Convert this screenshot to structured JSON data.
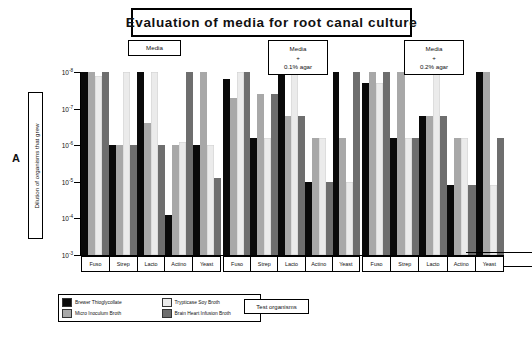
{
  "title": "Evaluation of media for root canal culture",
  "figure_letter": "A",
  "y_axis_title": "Dilution of organisms that grew",
  "x_axis_title": "Test organisms",
  "panels": [
    {
      "line1": "Media",
      "line2": "",
      "line3": ""
    },
    {
      "line1": "Media",
      "line2": "+",
      "line3": "0.1% agar"
    },
    {
      "line1": "Media",
      "line2": "+",
      "line3": "0.2% agar"
    }
  ],
  "legend": [
    {
      "label": "Brewer Thioglycollate",
      "color": "#0a0a0a"
    },
    {
      "label": "Trypticase Soy Broth",
      "color": "#ebebeb"
    },
    {
      "label": "Micro Inoculum Broth",
      "color": "#a8a8a8"
    },
    {
      "label": "Brain Heart Infusion Broth",
      "color": "#6e6e6e"
    }
  ],
  "chart_data": {
    "type": "bar",
    "title": "Evaluation of media for root canal culture",
    "xlabel": "Test organisms",
    "ylabel": "Dilution of organisms that grew",
    "y_tick_labels": [
      "10-8",
      "10-7",
      "10-6",
      "10-5",
      "10-4",
      "10-3"
    ],
    "y_exponents": [
      -8,
      -7,
      -6,
      -5,
      -4,
      -3
    ],
    "ylim": [
      -3,
      -8
    ],
    "grid": false,
    "legend_position": "bottom-left",
    "categories": [
      "Fuso",
      "Strep",
      "Lacto",
      "Actino",
      "Yeast"
    ],
    "panel_names": [
      "Media",
      "Media + 0.1% agar",
      "Media + 0.2% agar"
    ],
    "series": [
      {
        "name": "Brewer Thioglycollate",
        "color": "#0a0a0a"
      },
      {
        "name": "Micro Inoculum Broth",
        "color": "#a8a8a8"
      },
      {
        "name": "Trypticase Soy Broth",
        "color": "#ebebeb"
      },
      {
        "name": "Brain Heart Infusion Broth",
        "color": "#6e6e6e"
      }
    ],
    "panels": [
      {
        "name": "Media",
        "values": {
          "Brewer Thioglycollate": [
            -8.0,
            -6.0,
            -8.0,
            -4.1,
            -6.0
          ],
          "Micro Inoculum Broth": [
            -8.0,
            -6.0,
            -6.6,
            -6.0,
            -8.0
          ],
          "Trypticase Soy Broth": [
            -7.9,
            -8.0,
            -8.0,
            -6.1,
            -6.0
          ],
          "Brain Heart Infusion Broth": [
            -8.0,
            -6.0,
            -6.0,
            -8.0,
            -5.1
          ]
        }
      },
      {
        "name": "Media + 0.1% agar",
        "values": {
          "Brewer Thioglycollate": [
            -7.8,
            -6.2,
            -8.0,
            -5.0,
            -8.0
          ],
          "Micro Inoculum Broth": [
            -7.3,
            -7.4,
            -6.8,
            -6.2,
            -6.2
          ],
          "Trypticase Soy Broth": [
            -8.0,
            -6.2,
            -8.0,
            -6.2,
            -5.0
          ],
          "Brain Heart Infusion Broth": [
            -8.0,
            -7.4,
            -6.8,
            -5.0,
            -8.0
          ]
        }
      },
      {
        "name": "Media + 0.2% agar",
        "values": {
          "Brewer Thioglycollate": [
            -7.7,
            -6.2,
            -6.8,
            -4.9,
            -8.0
          ],
          "Micro Inoculum Broth": [
            -8.0,
            -8.0,
            -6.8,
            -6.2,
            -8.0
          ],
          "Trypticase Soy Broth": [
            -7.7,
            -6.2,
            -8.0,
            -6.2,
            -4.9
          ],
          "Brain Heart Infusion Broth": [
            -8.0,
            -6.2,
            -6.8,
            -4.9,
            -6.2
          ]
        }
      }
    ]
  }
}
